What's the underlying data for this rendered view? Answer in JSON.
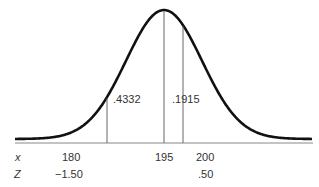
{
  "diagram": {
    "type": "normal-distribution-curve",
    "mean": 195,
    "sd": 10,
    "row_labels": {
      "x": "x",
      "z": "Z"
    },
    "markers": [
      {
        "x_label": "180",
        "z_label": "−1.50",
        "x": 180
      },
      {
        "x_label": "195",
        "z_label": "",
        "x": 195
      },
      {
        "x_label": "200",
        "z_label": ".50",
        "x": 200
      }
    ],
    "areas": [
      {
        "label": ".4332",
        "from": 180,
        "to": 195
      },
      {
        "label": ".1915",
        "from": 195,
        "to": 200
      }
    ],
    "colors": {
      "curve": "#111111",
      "lines": "#777777",
      "text": "#333333"
    }
  }
}
